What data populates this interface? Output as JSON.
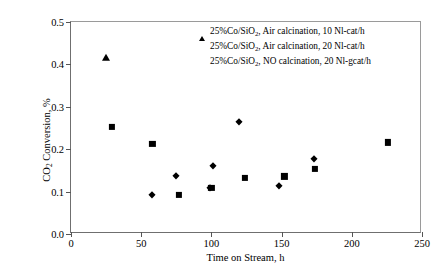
{
  "chart_data": {
    "type": "scatter",
    "title": "",
    "xlabel": "Time on Stream, h",
    "ylabel": "CO2 Conversion, %",
    "ylabel_parts": {
      "pre": "CO",
      "sub": "2",
      "post": " Conversion, %"
    },
    "xlim": [
      0,
      250
    ],
    "ylim": [
      0,
      0.5
    ],
    "xticks": [
      0,
      50,
      100,
      150,
      200,
      250
    ],
    "yticks": [
      "0.0",
      "0.1",
      "0.2",
      "0.3",
      "0.4",
      "0.5"
    ],
    "ytick_values": [
      0.0,
      0.1,
      0.2,
      0.3,
      0.4,
      0.5
    ],
    "grid": false,
    "legend_position": "top-center-right",
    "series": [
      {
        "name": "25%Co/SiO2, Air calcination, 10 Nl-cat/h",
        "marker": "triangle",
        "color": "#000000",
        "points": [
          {
            "x": 25,
            "y": 0.415
          }
        ]
      },
      {
        "name": "25%Co/SiO2, Air calcination, 20 Nl-cat/h",
        "marker": "diamond",
        "color": "#000000",
        "points": [
          {
            "x": 58,
            "y": 0.092
          },
          {
            "x": 75,
            "y": 0.137
          },
          {
            "x": 99,
            "y": 0.108
          },
          {
            "x": 101,
            "y": 0.16
          },
          {
            "x": 120,
            "y": 0.265
          },
          {
            "x": 148,
            "y": 0.114
          },
          {
            "x": 173,
            "y": 0.178
          }
        ]
      },
      {
        "name": "25%Co/SiO2, NO calcination, 20 Nl-gcat/h",
        "marker": "square",
        "color": "#000000",
        "points": [
          {
            "x": 29,
            "y": 0.252
          },
          {
            "x": 58,
            "y": 0.213
          },
          {
            "x": 77,
            "y": 0.092
          },
          {
            "x": 100,
            "y": 0.108
          },
          {
            "x": 124,
            "y": 0.132
          },
          {
            "x": 152,
            "y": 0.136
          },
          {
            "x": 174,
            "y": 0.154
          },
          {
            "x": 226,
            "y": 0.216
          }
        ]
      }
    ]
  },
  "legend": {
    "entries": [
      {
        "marker": "triangle",
        "pre": "25%Co/SiO",
        "sub": "2",
        "post": ", Air calcination, 10 Nl-cat/h"
      },
      {
        "marker": "diamond",
        "pre": "25%Co/SiO",
        "sub": "2",
        "post": ", Air calcination, 20 Nl-cat/h"
      },
      {
        "marker": "square",
        "pre": "25%Co/SiO",
        "sub": "2",
        "post": ", NO calcination, 20 Nl-gcat/h"
      }
    ]
  }
}
